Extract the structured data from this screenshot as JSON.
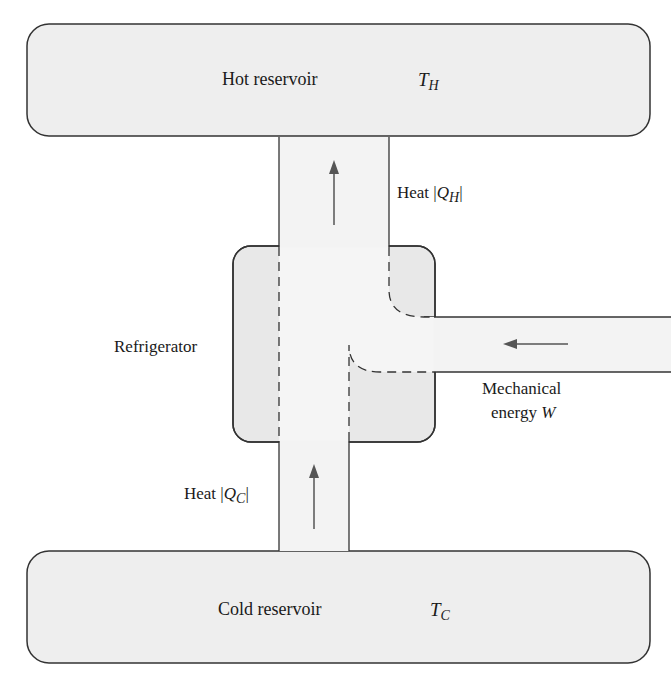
{
  "diagram": {
    "colors": {
      "reservoir_fill": "#eeeeee",
      "channel_fill": "#f3f3f3",
      "stroke": "#333333",
      "arrow": "#555555"
    },
    "hot_reservoir": {
      "label": "Hot reservoir",
      "temp_symbol": "T",
      "temp_sub": "H"
    },
    "cold_reservoir": {
      "label": "Cold reservoir",
      "temp_symbol": "T",
      "temp_sub": "C"
    },
    "device": {
      "label": "Refrigerator"
    },
    "heat_out": {
      "prefix": "Heat |",
      "symbol": "Q",
      "sub": "H",
      "suffix": "|"
    },
    "heat_in": {
      "prefix": "Heat |",
      "symbol": "Q",
      "sub": "C",
      "suffix": "|"
    },
    "work_in": {
      "line1": "Mechanical",
      "line2_prefix": "energy ",
      "line2_symbol": "W"
    }
  }
}
